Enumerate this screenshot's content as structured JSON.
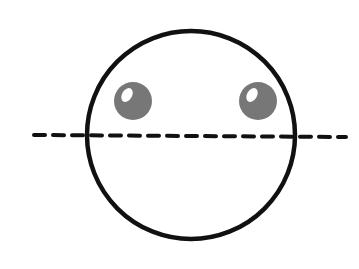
{
  "diagram": {
    "background": "#ffffff",
    "face": {
      "cx": 191,
      "cy": 135,
      "r": 104,
      "stroke": "#111111",
      "stroke_width": 4.5,
      "fill": "#ffffff"
    },
    "eyes": [
      {
        "name": "left",
        "cx": 133,
        "cy": 101,
        "r": 19,
        "fill": "#777777",
        "highlight": {
          "cx": 127,
          "cy": 95,
          "rx": 5,
          "ry": 7.5,
          "rotate": 30,
          "fill": "#ffffff"
        }
      },
      {
        "name": "right",
        "cx": 258,
        "cy": 101,
        "r": 19,
        "fill": "#777777",
        "highlight": {
          "cx": 252,
          "cy": 95,
          "rx": 5,
          "ry": 7.5,
          "rotate": 30,
          "fill": "#ffffff"
        }
      }
    ],
    "dashed_line": {
      "x1": 34,
      "y1": 135,
      "x2": 346,
      "y2": 137,
      "stroke": "#111111",
      "stroke_width": 4,
      "dash": "11 8"
    }
  }
}
